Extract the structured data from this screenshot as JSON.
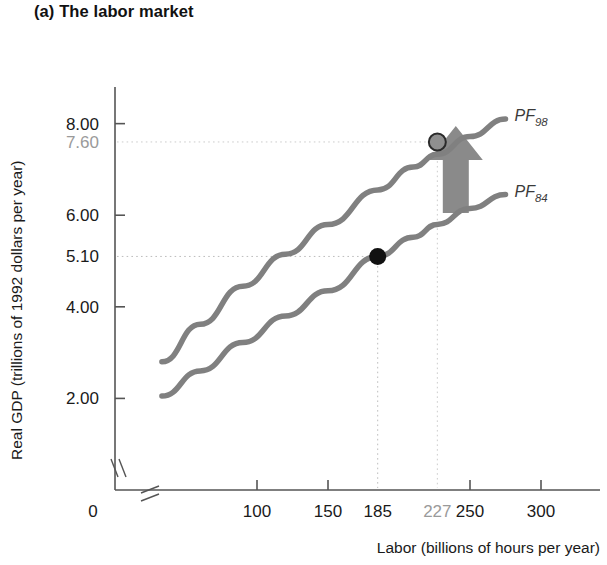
{
  "panel": {
    "title": "(a) The labor market"
  },
  "colors": {
    "curve": "#808080",
    "arrow": "#8a8a8a",
    "axis": "#555555",
    "gridline": "#bdbdbd",
    "gridline_muted": "#cccccc",
    "label_dark": "#1a1a1a",
    "label_muted": "#9a9a9a",
    "marker_dark": "#111111",
    "marker_light": "#8f8f8f"
  },
  "chart_data": {
    "type": "line",
    "title": "(a) The labor market",
    "xlabel": "Labor (billions of hours per year)",
    "ylabel": "Real GDP (trillions of 1992 dollars per year)",
    "xlim": [
      0,
      300
    ],
    "ylim": [
      0,
      8.8
    ],
    "x_break": true,
    "y_break": true,
    "grid": false,
    "legend": "inline-curve-labels",
    "x_ticks": [
      {
        "value": 0,
        "label": "0",
        "style": "dark",
        "tickmark": false
      },
      {
        "value": 100,
        "label": "100",
        "style": "dark",
        "tickmark": true
      },
      {
        "value": 150,
        "label": "150",
        "style": "dark",
        "tickmark": true
      },
      {
        "value": 185,
        "label": "185",
        "style": "dark",
        "tickmark": false
      },
      {
        "value": 227,
        "label": "227",
        "style": "muted",
        "tickmark": false
      },
      {
        "value": 250,
        "label": "250",
        "style": "dark",
        "tickmark": true
      },
      {
        "value": 300,
        "label": "300",
        "style": "dark",
        "tickmark": true
      }
    ],
    "y_ticks": [
      {
        "value": 8.0,
        "label": "8.00",
        "style": "dark",
        "tickmark": true
      },
      {
        "value": 7.6,
        "label": "7.60",
        "style": "muted",
        "tickmark": false
      },
      {
        "value": 6.0,
        "label": "6.00",
        "style": "dark",
        "tickmark": true
      },
      {
        "value": 5.1,
        "label": "5.10",
        "style": "dark",
        "tickmark": false
      },
      {
        "value": 4.0,
        "label": "4.00",
        "style": "dark",
        "tickmark": true
      },
      {
        "value": 2.0,
        "label": "2.00",
        "style": "dark",
        "tickmark": true
      }
    ],
    "dropline_x_values": [
      185,
      227
    ],
    "dropline_y_values": [
      7.6,
      5.1
    ],
    "series": [
      {
        "name": "PF_98",
        "label_base": "PF",
        "label_sub": "98",
        "x": [
          33,
          60,
          90,
          120,
          150,
          185,
          210,
          227,
          250,
          275
        ],
        "y": [
          2.8,
          3.62,
          4.45,
          5.15,
          5.8,
          6.55,
          7.05,
          7.33,
          7.72,
          8.1
        ]
      },
      {
        "name": "PF_84",
        "label_base": "PF",
        "label_sub": "84",
        "x": [
          33,
          60,
          90,
          120,
          150,
          185,
          210,
          227,
          250,
          275
        ],
        "y": [
          2.05,
          2.6,
          3.22,
          3.8,
          4.35,
          5.1,
          5.52,
          5.8,
          6.15,
          6.45
        ]
      }
    ],
    "points": [
      {
        "name": "point-pf84",
        "x": 185,
        "y": 5.1,
        "style": "filled-dark"
      },
      {
        "name": "point-pf98",
        "x": 227,
        "y": 7.6,
        "style": "filled-light"
      }
    ],
    "annotations": [
      {
        "name": "growth-arrow",
        "type": "up-arrow",
        "x": 240,
        "y_from": 6.05,
        "y_to": 7.95
      }
    ]
  }
}
